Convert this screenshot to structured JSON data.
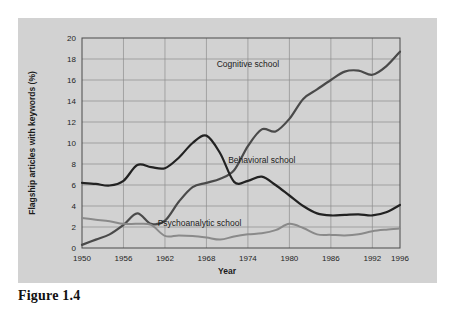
{
  "caption": "Figure 1.4",
  "chart_data": {
    "type": "line",
    "title": "",
    "xlabel": "Year",
    "ylabel": "Flagship articles with keywords (%)",
    "xlim": [
      1950,
      1996
    ],
    "ylim": [
      0,
      20
    ],
    "grid": true,
    "legend_position": "inline-annotations",
    "x_ticks": [
      "1950",
      "1956",
      "1962",
      "1968",
      "1974",
      "1980",
      "1986",
      "1992",
      "1996"
    ],
    "y_ticks": [
      "0",
      "2",
      "4",
      "6",
      "8",
      "10",
      "12",
      "14",
      "16",
      "18",
      "20"
    ],
    "colors": {
      "cognitive": "#4a4a4a",
      "behavioral": "#222222",
      "psychoanalytic": "#8a8a8a",
      "background": "#d2d2d2",
      "grid": "#8e8e8e"
    },
    "series": [
      {
        "name": "Cognitive school",
        "color": "#4a4a4a",
        "label_x": 1974,
        "label_y": 17.2,
        "x": [
          1950,
          1952,
          1954,
          1956,
          1958,
          1960,
          1962,
          1964,
          1966,
          1968,
          1970,
          1972,
          1974,
          1976,
          1978,
          1980,
          1982,
          1984,
          1986,
          1988,
          1990,
          1992,
          1994,
          1996
        ],
        "values": [
          0.3,
          0.8,
          1.3,
          2.2,
          3.3,
          2.3,
          2.6,
          4.4,
          5.8,
          6.2,
          6.6,
          7.4,
          9.7,
          11.3,
          11.1,
          12.3,
          14.2,
          15.1,
          16.0,
          16.8,
          16.9,
          16.5,
          17.3,
          18.7
        ]
      },
      {
        "name": "Behavioral school",
        "color": "#222222",
        "label_x": 1976,
        "label_y": 8.1,
        "x": [
          1950,
          1952,
          1954,
          1956,
          1958,
          1960,
          1962,
          1964,
          1966,
          1968,
          1970,
          1972,
          1974,
          1976,
          1978,
          1980,
          1982,
          1984,
          1986,
          1988,
          1990,
          1992,
          1994,
          1996
        ],
        "values": [
          6.2,
          6.1,
          5.95,
          6.4,
          7.9,
          7.7,
          7.6,
          8.6,
          10.0,
          10.7,
          9.0,
          6.3,
          6.4,
          6.8,
          6.0,
          5.0,
          4.0,
          3.3,
          3.1,
          3.15,
          3.2,
          3.1,
          3.4,
          4.1
        ]
      },
      {
        "name": "Psychoanalytic school",
        "color": "#8a8a8a",
        "label_x": 1967,
        "label_y": 2.1,
        "x": [
          1950,
          1952,
          1954,
          1956,
          1958,
          1960,
          1962,
          1964,
          1966,
          1968,
          1970,
          1972,
          1974,
          1976,
          1978,
          1980,
          1982,
          1984,
          1986,
          1988,
          1990,
          1992,
          1994,
          1996
        ],
        "values": [
          2.85,
          2.7,
          2.55,
          2.3,
          2.3,
          2.2,
          1.15,
          1.2,
          1.15,
          1.0,
          0.8,
          1.1,
          1.3,
          1.4,
          1.7,
          2.3,
          1.9,
          1.3,
          1.25,
          1.2,
          1.3,
          1.6,
          1.75,
          1.85
        ]
      }
    ]
  }
}
